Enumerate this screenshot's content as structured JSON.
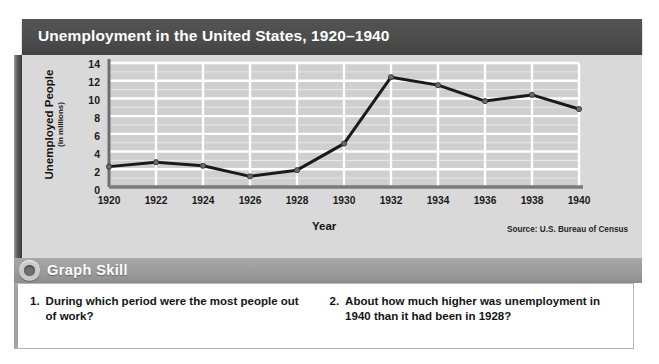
{
  "figure": {
    "title": "Unemployment in the United States, 1920–1940"
  },
  "chart_data": {
    "type": "line",
    "title": "Unemployment in the United States, 1920–1940",
    "xlabel": "Year",
    "ylabel": "Unemployed People",
    "ylabel_sub": "(in millions)",
    "source": "Source: U.S. Bureau of Census",
    "x": [
      1920,
      1922,
      1924,
      1926,
      1928,
      1930,
      1932,
      1934,
      1936,
      1938,
      1940
    ],
    "xtick_labels": [
      "1920",
      "1922",
      "1924",
      "1926",
      "1928",
      "1930",
      "1932",
      "1934",
      "1936",
      "1938",
      "1940"
    ],
    "values": [
      2.3,
      2.8,
      2.4,
      1.2,
      1.9,
      4.9,
      12.4,
      11.5,
      9.7,
      10.4,
      8.8
    ],
    "ytick_labels": [
      "14",
      "12",
      "10",
      "8",
      "6",
      "4",
      "2",
      "0"
    ],
    "yticks": [
      14,
      12,
      10,
      8,
      6,
      4,
      2,
      0
    ],
    "ylim": [
      0,
      14
    ],
    "xlim": [
      1920,
      1940
    ],
    "grid": true,
    "legend": "none",
    "series_color": "#1a1a1a",
    "marker_color": "#6e6e6e",
    "plot_bg": "#cfcfcf",
    "gridline_color": "#ffffff"
  },
  "skill": {
    "label": "Graph Skill",
    "icon": "ring-bullet-icon"
  },
  "questions": [
    {
      "number": "1.",
      "text": "During which period were the most people out of work?"
    },
    {
      "number": "2.",
      "text": "About how much higher was unemployment in 1940 than it had been in 1928?"
    }
  ],
  "colors": {
    "title_bar": "#4c4c4c",
    "panel": "#d9d9d9",
    "skill_band": "#9a9a9a",
    "question_bg": "#ffffff"
  }
}
